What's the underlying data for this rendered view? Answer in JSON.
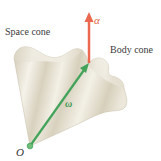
{
  "figure": {
    "labels": {
      "space_cone": "Space cone",
      "body_cone": "Body cone",
      "alpha": "α",
      "omega": "ω",
      "origin": "O"
    },
    "colors": {
      "alpha_vector": "#e9684f",
      "omega_vector": "#43a35a",
      "cone_fill": "#e6e1d3",
      "cone_highlight": "#f7f5ee",
      "cone_shadow": "#c9c2ad",
      "background": "#ffffff"
    }
  }
}
